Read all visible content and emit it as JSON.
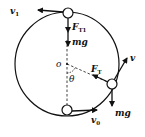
{
  "diagram": {
    "type": "vertical-circular-motion",
    "colors": {
      "stroke": "#111111",
      "background": "#ffffff"
    },
    "center_label": "o",
    "angle_label": "θ",
    "top_ball": {
      "velocity": {
        "main": "v",
        "sub": "1"
      },
      "tension": {
        "main": "F",
        "sub": "T1"
      },
      "gravity": "mg"
    },
    "side_ball": {
      "velocity": {
        "main": "v",
        "sub": ""
      },
      "tension": {
        "main": "F",
        "sub": "T"
      },
      "gravity": "mg"
    },
    "bottom_ball": {
      "velocity": {
        "main": "v",
        "sub": "0"
      }
    }
  }
}
